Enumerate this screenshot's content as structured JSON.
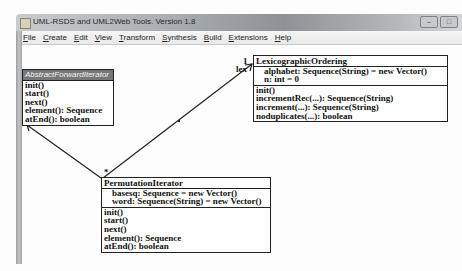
{
  "window": {
    "title": "UML-RSDS and UML2Web Tools. Version 1.8",
    "controls": [
      "minimize",
      "maximize"
    ]
  },
  "menubar": {
    "items": [
      {
        "label": "File"
      },
      {
        "label": "Create"
      },
      {
        "label": "Edit"
      },
      {
        "label": "View"
      },
      {
        "label": "Transform"
      },
      {
        "label": "Synthesis"
      },
      {
        "label": "Build"
      },
      {
        "label": "Extensions"
      },
      {
        "label": "Help"
      }
    ]
  },
  "diagram": {
    "classes": [
      {
        "id": "abstract-forward-iterator",
        "name": "AbstractForwardIterator",
        "abstract": true,
        "attributes": [],
        "operations": [
          "init()",
          "start()",
          "next()",
          "element(): Sequence",
          "atEnd(): boolean"
        ]
      },
      {
        "id": "lexicographic-ordering",
        "name": "LexicographicOrdering",
        "abstract": false,
        "attributes": [
          "alphabet: Sequence(String) = new Vector()",
          "n: int = 0"
        ],
        "operations": [
          "init()",
          "incrementRec(...): Sequence(String)",
          "increment(...): Sequence(String)",
          "noduplicates(...): boolean"
        ]
      },
      {
        "id": "permutation-iterator",
        "name": "PermutationIterator",
        "abstract": false,
        "attributes": [
          "basesq: Sequence = new Vector()",
          "word: Sequence(String) = new Vector()"
        ],
        "operations": [
          "init()",
          "start()",
          "next()",
          "element(): Sequence",
          "atEnd(): boolean"
        ]
      }
    ],
    "relations": [
      {
        "type": "inheritance",
        "from": "PermutationIterator",
        "to": "AbstractForwardIterator"
      },
      {
        "type": "association",
        "from": "PermutationIterator",
        "to": "LexicographicOrdering",
        "source_multiplicity": "*",
        "target_multiplicity": "1",
        "target_role": "lex"
      }
    ]
  }
}
